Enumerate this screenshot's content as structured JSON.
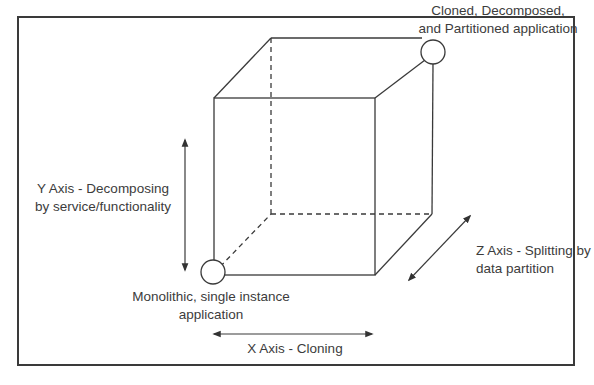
{
  "diagram": {
    "labels": {
      "top_corner": [
        "Cloned, Decomposed,",
        "and Partitioned application"
      ],
      "y_axis": [
        "Y Axis - Decomposing",
        "by service/functionality"
      ],
      "origin": [
        "Monolithic, single instance",
        "application"
      ],
      "x_axis": "X Axis - Cloning",
      "z_axis": [
        "Z Axis - Splitting by",
        "data partition"
      ]
    },
    "colors": {
      "line": "#3a3a3a",
      "text": "#3c3c3c",
      "background": "#ffffff"
    }
  }
}
